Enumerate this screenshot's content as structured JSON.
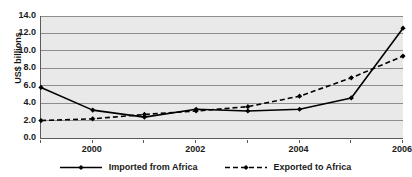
{
  "chart_data": {
    "type": "line",
    "title": "",
    "xlabel": "",
    "ylabel": "US$ billions",
    "x": [
      1999,
      2000,
      2001,
      2002,
      2003,
      2004,
      2005,
      2006
    ],
    "xtick_labels": [
      "2000",
      "2002",
      "2004",
      "2006"
    ],
    "xtick_values": [
      2000,
      2002,
      2004,
      2006
    ],
    "xlim": [
      1999,
      2006
    ],
    "ylim": [
      0.0,
      14.0
    ],
    "ytick_labels": [
      "0.0",
      "2.0",
      "4.0",
      "6.0",
      "8.0",
      "10.0",
      "12.0",
      "14.0"
    ],
    "ytick_values": [
      0.0,
      2.0,
      4.0,
      6.0,
      8.0,
      10.0,
      12.0,
      14.0
    ],
    "grid": true,
    "legend_position": "bottom",
    "series": [
      {
        "name": "Imported from Africa",
        "style": "solid",
        "marker": "diamond",
        "color": "#000000",
        "values": [
          5.8,
          3.2,
          2.4,
          3.3,
          3.1,
          3.3,
          4.6,
          12.6
        ]
      },
      {
        "name": "Exported to Africa",
        "style": "dashed",
        "marker": "diamond",
        "color": "#000000",
        "values": [
          2.0,
          2.2,
          2.7,
          3.1,
          3.6,
          4.8,
          6.9,
          9.4
        ]
      }
    ]
  },
  "colors": {
    "plot_background": "#e9e9e9",
    "gridline": "#8d8d8d",
    "axis": "#5a5a5a",
    "series": "#000000",
    "page_background": "#ffffff"
  }
}
